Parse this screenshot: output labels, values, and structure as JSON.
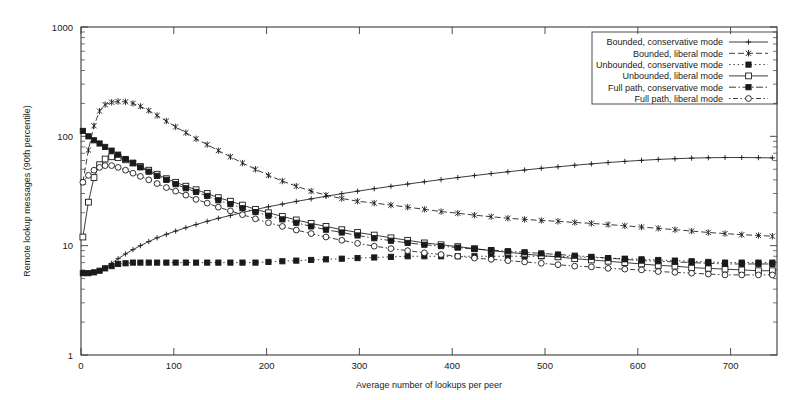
{
  "chart_data": {
    "type": "line",
    "title": "",
    "xlabel": "Average number of lookups per peer",
    "ylabel": "Remote lookup messages (90th percentile)",
    "xlim": [
      0,
      750
    ],
    "ylim": [
      1,
      1000
    ],
    "yscale": "log",
    "grid": false,
    "legend_position": "top-right",
    "xticks": [
      0,
      100,
      200,
      300,
      400,
      500,
      600,
      700
    ],
    "yticks": [
      1,
      10,
      100,
      1000
    ],
    "xtick_labels": [
      "0",
      "100",
      "200",
      "300",
      "400",
      "500",
      "600",
      "700"
    ],
    "ytick_labels": [
      "1",
      "10",
      "100",
      "1000"
    ],
    "series": [
      {
        "name": "Bounded, conservative mode",
        "marker": "plus",
        "dash": "none",
        "x": [
          2,
          8,
          14,
          20,
          26,
          33,
          40,
          48,
          56,
          64,
          73,
          82,
          92,
          102,
          113,
          124,
          136,
          148,
          161,
          174,
          188,
          202,
          217,
          232,
          248,
          264,
          281,
          298,
          316,
          334,
          352,
          370,
          388,
          406,
          424,
          442,
          460,
          478,
          496,
          514,
          532,
          550,
          568,
          586,
          604,
          622,
          640,
          658,
          676,
          694,
          712,
          730,
          745
        ],
        "y": [
          5.6,
          5.6,
          5.7,
          5.9,
          6.3,
          6.9,
          7.6,
          8.4,
          9.2,
          10.0,
          10.9,
          11.8,
          12.7,
          13.6,
          14.6,
          15.6,
          16.7,
          17.8,
          18.9,
          20.1,
          21.4,
          22.7,
          24.0,
          25.4,
          26.8,
          28.3,
          29.9,
          31.5,
          33.2,
          34.9,
          36.6,
          38.4,
          40.2,
          42.0,
          43.8,
          45.6,
          47.4,
          49.2,
          51.0,
          52.7,
          54.4,
          56.0,
          57.6,
          59.0,
          60.3,
          61.5,
          62.4,
          63.2,
          63.7,
          64.0,
          64.0,
          63.8,
          63.5
        ]
      },
      {
        "name": "Bounded, liberal mode",
        "marker": "star",
        "dash": "dash",
        "x": [
          2,
          8,
          14,
          20,
          26,
          33,
          40,
          48,
          56,
          64,
          73,
          82,
          92,
          102,
          113,
          124,
          136,
          148,
          161,
          174,
          188,
          202,
          217,
          232,
          248,
          264,
          281,
          298,
          316,
          334,
          352,
          370,
          388,
          406,
          424,
          442,
          460,
          478,
          496,
          514,
          532,
          550,
          568,
          586,
          604,
          622,
          640,
          658,
          676,
          694,
          712,
          730,
          745
        ],
        "y": [
          38,
          75,
          125,
          170,
          195,
          205,
          208,
          207,
          200,
          188,
          172,
          155,
          138,
          122,
          108,
          95,
          84,
          74,
          65,
          57,
          50,
          44,
          39,
          35,
          31.5,
          29,
          27,
          25.5,
          24.5,
          23.5,
          22.5,
          21.5,
          20.5,
          19.8,
          19.0,
          18.4,
          17.8,
          17.4,
          17.0,
          16.7,
          16.3,
          16.0,
          15.6,
          15.2,
          14.8,
          14.4,
          14.0,
          13.6,
          13.2,
          12.9,
          12.6,
          12.4,
          12.2
        ]
      },
      {
        "name": "Unbounded, conservative mode",
        "marker": "fsquare",
        "dash": "dot",
        "x": [
          2,
          8,
          14,
          20,
          26,
          33,
          40,
          48,
          56,
          64,
          73,
          82,
          92,
          102,
          113,
          124,
          136,
          148,
          161,
          174,
          188,
          202,
          217,
          232,
          248,
          264,
          281,
          298,
          316,
          334,
          352,
          370,
          388,
          406,
          424,
          442,
          460,
          478,
          496,
          514,
          532,
          550,
          568,
          586,
          604,
          622,
          640,
          658,
          676,
          694,
          712,
          730,
          745
        ],
        "y": [
          5.6,
          5.6,
          5.7,
          5.9,
          6.2,
          6.5,
          6.8,
          6.9,
          7.0,
          7.0,
          7.0,
          7.0,
          7.0,
          7.0,
          7.0,
          7.0,
          7.0,
          7.0,
          7.0,
          7.0,
          7.0,
          7.1,
          7.2,
          7.3,
          7.4,
          7.5,
          7.6,
          7.7,
          7.8,
          7.9,
          8.0,
          8.0,
          8.0,
          8.0,
          8.0,
          8.0,
          8.0,
          8.0,
          8.0,
          8.0,
          7.9,
          7.8,
          7.7,
          7.6,
          7.5,
          7.4,
          7.3,
          7.2,
          7.1,
          7.0,
          7.0,
          7.0,
          7.0
        ]
      },
      {
        "name": "Unbounded, liberal mode",
        "marker": "osquare",
        "dash": "solid",
        "x": [
          2,
          8,
          14,
          20,
          26,
          33,
          40,
          48,
          56,
          64,
          73,
          82,
          92,
          102,
          113,
          124,
          136,
          148,
          161,
          174,
          188,
          202,
          217,
          232,
          248,
          264,
          281,
          298,
          316,
          334,
          352,
          370,
          388,
          406,
          424,
          442,
          460,
          478,
          496,
          514,
          532,
          550,
          568,
          586,
          604,
          622,
          640,
          658,
          676,
          694,
          712,
          730,
          745
        ],
        "y": [
          12.0,
          25,
          42,
          55,
          62,
          65,
          64,
          61,
          57,
          53,
          49,
          45,
          41,
          38,
          35,
          32.5,
          30,
          27.5,
          25.5,
          23.5,
          21.5,
          20.0,
          18.5,
          17.2,
          16.0,
          15.0,
          14.0,
          13.2,
          12.5,
          11.8,
          11.2,
          10.6,
          10.2,
          9.8,
          9.4,
          9.0,
          8.7,
          8.4,
          8.1,
          7.9,
          7.6,
          7.4,
          7.2,
          7.0,
          6.8,
          6.6,
          6.5,
          6.3,
          6.2,
          6.1,
          6.0,
          5.9,
          5.9
        ]
      },
      {
        "name": "Full path, conservative mode",
        "marker": "fsquare",
        "dash": "dashdot",
        "x": [
          2,
          8,
          14,
          20,
          26,
          33,
          40,
          48,
          56,
          64,
          73,
          82,
          92,
          102,
          113,
          124,
          136,
          148,
          161,
          174,
          188,
          202,
          217,
          232,
          248,
          264,
          281,
          298,
          316,
          334,
          352,
          370,
          388,
          406,
          424,
          442,
          460,
          478,
          496,
          514,
          532,
          550,
          568,
          586,
          604,
          622,
          640,
          658,
          676,
          694,
          712,
          730,
          745
        ],
        "y": [
          112,
          100,
          92,
          86,
          80,
          74,
          68,
          62,
          57,
          52,
          47.5,
          43.5,
          40,
          36.5,
          33.5,
          31,
          28.5,
          26,
          24,
          22,
          20.3,
          18.8,
          17.4,
          16.2,
          15.0,
          14.0,
          13.2,
          12.4,
          11.7,
          11.1,
          10.6,
          10.2,
          9.9,
          9.6,
          9.3,
          9.1,
          8.9,
          8.7,
          8.5,
          8.3,
          8.1,
          7.9,
          7.7,
          7.5,
          7.3,
          7.2,
          7.1,
          7.0,
          6.9,
          6.8,
          6.8,
          6.8,
          6.8
        ]
      },
      {
        "name": "Full path, liberal mode",
        "marker": "ocircle",
        "dash": "dashdot2",
        "x": [
          2,
          8,
          14,
          20,
          26,
          33,
          40,
          48,
          56,
          64,
          73,
          82,
          92,
          102,
          113,
          124,
          136,
          148,
          161,
          174,
          188,
          202,
          217,
          232,
          248,
          264,
          281,
          298,
          316,
          334,
          352,
          370,
          388,
          406,
          424,
          442,
          460,
          478,
          496,
          514,
          532,
          550,
          568,
          586,
          604,
          622,
          640,
          658,
          676,
          694,
          712,
          730,
          745
        ],
        "y": [
          38,
          44,
          49,
          52,
          54,
          54,
          52,
          49,
          46,
          43,
          40,
          37,
          34,
          31.5,
          29,
          26.5,
          24.5,
          22.5,
          20.8,
          19.2,
          17.6,
          16.2,
          15.0,
          13.9,
          12.9,
          12.0,
          11.2,
          10.5,
          9.9,
          9.4,
          9.0,
          8.6,
          8.3,
          8.0,
          7.7,
          7.5,
          7.3,
          7.1,
          6.9,
          6.7,
          6.5,
          6.4,
          6.2,
          6.1,
          6.0,
          5.8,
          5.7,
          5.6,
          5.5,
          5.4,
          5.4,
          5.4,
          5.4
        ]
      }
    ]
  },
  "legend": {
    "entries": [
      "Bounded, conservative mode",
      "Bounded, liberal mode",
      "Unbounded, conservative mode",
      "Unbounded, liberal mode",
      "Full path, conservative mode",
      "Full path, liberal mode"
    ]
  },
  "colors": {
    "line": "#1a1a1a",
    "axis": "#3a3a3a",
    "background": "#ffffff"
  }
}
